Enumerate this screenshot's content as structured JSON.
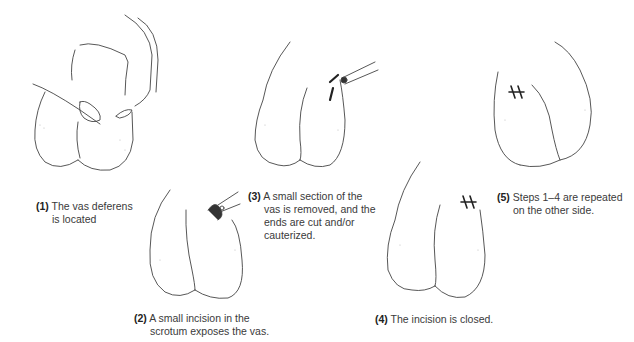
{
  "figure": {
    "steps": [
      {
        "number": "(1)",
        "line1": "The vas deferens",
        "line2": "is located",
        "line3": "",
        "line4": ""
      },
      {
        "number": "(2)",
        "line1": "A small incision in the",
        "line2": "scrotum exposes the vas.",
        "line3": "",
        "line4": ""
      },
      {
        "number": "(3)",
        "line1": "A small section of the",
        "line2": "vas is removed, and the",
        "line3": "ends are cut and/or",
        "line4": "cauterized."
      },
      {
        "number": "(4)",
        "line1": "The incision is closed.",
        "line2": "",
        "line3": "",
        "line4": ""
      },
      {
        "number": "(5)",
        "line1": "Steps 1–4 are repeated",
        "line2": "on the other side.",
        "line3": "",
        "line4": ""
      }
    ]
  }
}
